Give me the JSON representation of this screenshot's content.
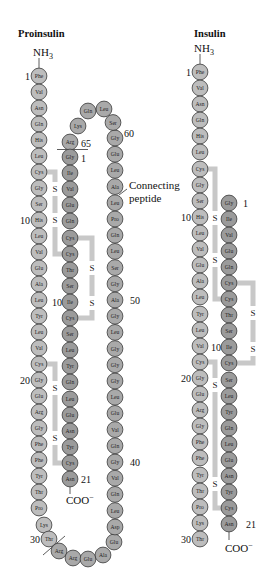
{
  "colors": {
    "b_chain_fill": "#bdbdbd",
    "a_chain_fill": "#9b9b9b",
    "c_peptide_fill": "#a9a9a9",
    "residue_stroke": "#3a3a3a",
    "bridge": "#c8c8c8"
  },
  "proinsulin": {
    "title": "Proinsulin",
    "n_terminus": {
      "base": "NH",
      "sub": "3"
    },
    "c_terminus": {
      "base": "COO",
      "sup": "−"
    },
    "connecting_peptide_label": {
      "line1": "Connecting",
      "line2": "peptide"
    },
    "disulfide_label": "S",
    "numbers": {
      "b1": "1",
      "b10": "10",
      "b20": "20",
      "b30": "30",
      "a1": "1",
      "a10": "10",
      "a21": "21",
      "c40": "40",
      "c50": "50",
      "c60": "60",
      "c65": "65"
    },
    "b_chain": [
      {
        "n": 1,
        "aa": "Phe",
        "x": 39,
        "y": 76
      },
      {
        "n": 2,
        "aa": "Val",
        "x": 39,
        "y": 92
      },
      {
        "n": 3,
        "aa": "Asn",
        "x": 39,
        "y": 108
      },
      {
        "n": 4,
        "aa": "Gln",
        "x": 39,
        "y": 124
      },
      {
        "n": 5,
        "aa": "His",
        "x": 39,
        "y": 140
      },
      {
        "n": 6,
        "aa": "Leu",
        "x": 39,
        "y": 156
      },
      {
        "n": 7,
        "aa": "Cys",
        "x": 39,
        "y": 172
      },
      {
        "n": 8,
        "aa": "Gly",
        "x": 39,
        "y": 188
      },
      {
        "n": 9,
        "aa": "Ser",
        "x": 39,
        "y": 204
      },
      {
        "n": 10,
        "aa": "His",
        "x": 39,
        "y": 220
      },
      {
        "n": 11,
        "aa": "Leu",
        "x": 39,
        "y": 236
      },
      {
        "n": 12,
        "aa": "Val",
        "x": 39,
        "y": 252
      },
      {
        "n": 13,
        "aa": "Glu",
        "x": 39,
        "y": 268
      },
      {
        "n": 14,
        "aa": "Ala",
        "x": 39,
        "y": 284
      },
      {
        "n": 15,
        "aa": "Leu",
        "x": 39,
        "y": 300
      },
      {
        "n": 16,
        "aa": "Tyr",
        "x": 39,
        "y": 316
      },
      {
        "n": 17,
        "aa": "Leu",
        "x": 39,
        "y": 332
      },
      {
        "n": 18,
        "aa": "Val",
        "x": 39,
        "y": 348
      },
      {
        "n": 19,
        "aa": "Cys",
        "x": 39,
        "y": 364
      },
      {
        "n": 20,
        "aa": "Gly",
        "x": 39,
        "y": 380
      },
      {
        "n": 21,
        "aa": "Glu",
        "x": 39,
        "y": 396
      },
      {
        "n": 22,
        "aa": "Arg",
        "x": 39,
        "y": 412
      },
      {
        "n": 23,
        "aa": "Gly",
        "x": 39,
        "y": 428
      },
      {
        "n": 24,
        "aa": "Phe",
        "x": 39,
        "y": 444
      },
      {
        "n": 25,
        "aa": "Phe",
        "x": 39,
        "y": 460
      },
      {
        "n": 26,
        "aa": "Tyr",
        "x": 39,
        "y": 476
      },
      {
        "n": 27,
        "aa": "Thr",
        "x": 39,
        "y": 492
      },
      {
        "n": 28,
        "aa": "Pro",
        "x": 39,
        "y": 508
      },
      {
        "n": 29,
        "aa": "Lys",
        "x": 44,
        "y": 525
      },
      {
        "n": 30,
        "aa": "Thr",
        "x": 49,
        "y": 539
      }
    ],
    "c_peptide": [
      {
        "n": 31,
        "aa": "Arg",
        "x": 59,
        "y": 551
      },
      {
        "n": 32,
        "aa": "Arg",
        "x": 73,
        "y": 558
      },
      {
        "n": 33,
        "aa": "Glu",
        "x": 88,
        "y": 559
      },
      {
        "n": 34,
        "aa": "Ala",
        "x": 103,
        "y": 555
      },
      {
        "n": 35,
        "aa": "Glu",
        "x": 114,
        "y": 542
      },
      {
        "n": 36,
        "aa": "Asp",
        "x": 115,
        "y": 527
      },
      {
        "n": 37,
        "aa": "Leu",
        "x": 115,
        "y": 510.6
      },
      {
        "n": 38,
        "aa": "Gln",
        "x": 115,
        "y": 494.4
      },
      {
        "n": 39,
        "aa": "Val",
        "x": 115,
        "y": 478.2
      },
      {
        "n": 40,
        "aa": "Gly",
        "x": 115,
        "y": 462
      },
      {
        "n": 41,
        "aa": "Gln",
        "x": 115,
        "y": 445.8
      },
      {
        "n": 42,
        "aa": "Val",
        "x": 115,
        "y": 429.6
      },
      {
        "n": 43,
        "aa": "Glu",
        "x": 115,
        "y": 413.4
      },
      {
        "n": 44,
        "aa": "Leu",
        "x": 115,
        "y": 397.2
      },
      {
        "n": 45,
        "aa": "Gly",
        "x": 115,
        "y": 381
      },
      {
        "n": 46,
        "aa": "Gly",
        "x": 115,
        "y": 364.8
      },
      {
        "n": 47,
        "aa": "Gly",
        "x": 115,
        "y": 348.6
      },
      {
        "n": 48,
        "aa": "Leu",
        "x": 115,
        "y": 332.4
      },
      {
        "n": 49,
        "aa": "Gly",
        "x": 115,
        "y": 316.2
      },
      {
        "n": 50,
        "aa": "Ala",
        "x": 115,
        "y": 300
      },
      {
        "n": 51,
        "aa": "Gly",
        "x": 115,
        "y": 283.8
      },
      {
        "n": 52,
        "aa": "Ser",
        "x": 115,
        "y": 267.6
      },
      {
        "n": 53,
        "aa": "Leu",
        "x": 115,
        "y": 251.4
      },
      {
        "n": 54,
        "aa": "Gln",
        "x": 115,
        "y": 235.2
      },
      {
        "n": 55,
        "aa": "Pro",
        "x": 115,
        "y": 219
      },
      {
        "n": 56,
        "aa": "Leu",
        "x": 115,
        "y": 202.8
      },
      {
        "n": 57,
        "aa": "Ala",
        "x": 115,
        "y": 186.6
      },
      {
        "n": 58,
        "aa": "Leu",
        "x": 115,
        "y": 170.4
      },
      {
        "n": 59,
        "aa": "Glu",
        "x": 115,
        "y": 154.2
      },
      {
        "n": 60,
        "aa": "Gly",
        "x": 115,
        "y": 138
      },
      {
        "n": 61,
        "aa": "Ser",
        "x": 113,
        "y": 122.5
      },
      {
        "n": 62,
        "aa": "Leu",
        "x": 104,
        "y": 109
      },
      {
        "n": 63,
        "aa": "Gln",
        "x": 88,
        "y": 111
      },
      {
        "n": 64,
        "aa": "Lys",
        "x": 78,
        "y": 126
      },
      {
        "n": 65,
        "aa": "Arg",
        "x": 70,
        "y": 142
      }
    ],
    "a_chain": [
      {
        "n": 1,
        "aa": "Gly",
        "x": 70,
        "y": 157
      },
      {
        "n": 2,
        "aa": "Ile",
        "x": 70,
        "y": 173
      },
      {
        "n": 3,
        "aa": "Val",
        "x": 70,
        "y": 189
      },
      {
        "n": 4,
        "aa": "Glu",
        "x": 70,
        "y": 205
      },
      {
        "n": 5,
        "aa": "Gln",
        "x": 70,
        "y": 221
      },
      {
        "n": 6,
        "aa": "Cys",
        "x": 70,
        "y": 238
      },
      {
        "n": 7,
        "aa": "Cys",
        "x": 70,
        "y": 254
      },
      {
        "n": 8,
        "aa": "Thr",
        "x": 70,
        "y": 270
      },
      {
        "n": 9,
        "aa": "Ser",
        "x": 70,
        "y": 286
      },
      {
        "n": 10,
        "aa": "Ile",
        "x": 70,
        "y": 302
      },
      {
        "n": 11,
        "aa": "Cys",
        "x": 70,
        "y": 318
      },
      {
        "n": 12,
        "aa": "Ser",
        "x": 70,
        "y": 334
      },
      {
        "n": 13,
        "aa": "Leu",
        "x": 70,
        "y": 350
      },
      {
        "n": 14,
        "aa": "Tyr",
        "x": 70,
        "y": 366
      },
      {
        "n": 15,
        "aa": "Gln",
        "x": 70,
        "y": 382
      },
      {
        "n": 16,
        "aa": "Leu",
        "x": 70,
        "y": 399
      },
      {
        "n": 17,
        "aa": "Glu",
        "x": 70,
        "y": 415
      },
      {
        "n": 18,
        "aa": "Asn",
        "x": 70,
        "y": 431
      },
      {
        "n": 19,
        "aa": "Tyr",
        "x": 70,
        "y": 447
      },
      {
        "n": 20,
        "aa": "Cys",
        "x": 70,
        "y": 463
      },
      {
        "n": 21,
        "aa": "Asn",
        "x": 70,
        "y": 479
      }
    ]
  },
  "insulin": {
    "title": "Insulin",
    "n_terminus": {
      "base": "NH",
      "sub": "3"
    },
    "c_terminus": {
      "base": "COO",
      "sup": "−"
    },
    "disulfide_label": "S",
    "numbers": {
      "b1": "1",
      "b10": "10",
      "b20": "20",
      "b30": "30",
      "a1": "1",
      "a10": "10",
      "a21": "21"
    },
    "b_chain": [
      {
        "n": 1,
        "aa": "Phe",
        "x": 200,
        "y": 72
      },
      {
        "n": 2,
        "aa": "Val",
        "x": 200,
        "y": 88
      },
      {
        "n": 3,
        "aa": "Asn",
        "x": 200,
        "y": 104
      },
      {
        "n": 4,
        "aa": "Gln",
        "x": 200,
        "y": 120
      },
      {
        "n": 5,
        "aa": "His",
        "x": 200,
        "y": 136
      },
      {
        "n": 6,
        "aa": "Leu",
        "x": 200,
        "y": 152
      },
      {
        "n": 7,
        "aa": "Cys",
        "x": 200,
        "y": 169
      },
      {
        "n": 8,
        "aa": "Gly",
        "x": 200,
        "y": 185
      },
      {
        "n": 9,
        "aa": "Ser",
        "x": 200,
        "y": 201
      },
      {
        "n": 10,
        "aa": "His",
        "x": 200,
        "y": 217
      },
      {
        "n": 11,
        "aa": "Leu",
        "x": 200,
        "y": 233
      },
      {
        "n": 12,
        "aa": "Val",
        "x": 200,
        "y": 249
      },
      {
        "n": 13,
        "aa": "Glu",
        "x": 200,
        "y": 265
      },
      {
        "n": 14,
        "aa": "Ala",
        "x": 200,
        "y": 281
      },
      {
        "n": 15,
        "aa": "Leu",
        "x": 200,
        "y": 297
      },
      {
        "n": 16,
        "aa": "Tyr",
        "x": 200,
        "y": 314
      },
      {
        "n": 17,
        "aa": "Leu",
        "x": 200,
        "y": 330
      },
      {
        "n": 18,
        "aa": "Val",
        "x": 200,
        "y": 346
      },
      {
        "n": 19,
        "aa": "Cys",
        "x": 200,
        "y": 362
      },
      {
        "n": 20,
        "aa": "Gly",
        "x": 200,
        "y": 378
      },
      {
        "n": 21,
        "aa": "Glu",
        "x": 200,
        "y": 394
      },
      {
        "n": 22,
        "aa": "Arg",
        "x": 200,
        "y": 410
      },
      {
        "n": 23,
        "aa": "Gly",
        "x": 200,
        "y": 426
      },
      {
        "n": 24,
        "aa": "Phe",
        "x": 200,
        "y": 442
      },
      {
        "n": 25,
        "aa": "Phe",
        "x": 200,
        "y": 458
      },
      {
        "n": 26,
        "aa": "Tyr",
        "x": 200,
        "y": 475
      },
      {
        "n": 27,
        "aa": "Thr",
        "x": 200,
        "y": 491
      },
      {
        "n": 28,
        "aa": "Pro",
        "x": 200,
        "y": 507
      },
      {
        "n": 29,
        "aa": "Lys",
        "x": 200,
        "y": 523
      },
      {
        "n": 30,
        "aa": "Thr",
        "x": 200,
        "y": 539
      }
    ],
    "a_chain": [
      {
        "n": 1,
        "aa": "Gly",
        "x": 229,
        "y": 203
      },
      {
        "n": 2,
        "aa": "Ile",
        "x": 229,
        "y": 219
      },
      {
        "n": 3,
        "aa": "Val",
        "x": 229,
        "y": 235
      },
      {
        "n": 4,
        "aa": "Glu",
        "x": 229,
        "y": 251
      },
      {
        "n": 5,
        "aa": "Gln",
        "x": 229,
        "y": 267
      },
      {
        "n": 6,
        "aa": "Cys",
        "x": 229,
        "y": 283
      },
      {
        "n": 7,
        "aa": "Cys",
        "x": 229,
        "y": 299
      },
      {
        "n": 8,
        "aa": "Thr",
        "x": 229,
        "y": 315
      },
      {
        "n": 9,
        "aa": "Ser",
        "x": 229,
        "y": 331
      },
      {
        "n": 10,
        "aa": "Ile",
        "x": 229,
        "y": 347
      },
      {
        "n": 11,
        "aa": "Cys",
        "x": 229,
        "y": 363
      },
      {
        "n": 12,
        "aa": "Ser",
        "x": 229,
        "y": 380
      },
      {
        "n": 13,
        "aa": "Leu",
        "x": 229,
        "y": 396
      },
      {
        "n": 14,
        "aa": "Tyr",
        "x": 229,
        "y": 412
      },
      {
        "n": 15,
        "aa": "Gln",
        "x": 229,
        "y": 428
      },
      {
        "n": 16,
        "aa": "Leu",
        "x": 229,
        "y": 444
      },
      {
        "n": 17,
        "aa": "Glu",
        "x": 229,
        "y": 460
      },
      {
        "n": 18,
        "aa": "Asn",
        "x": 229,
        "y": 476
      },
      {
        "n": 19,
        "aa": "Tyr",
        "x": 229,
        "y": 492
      },
      {
        "n": 20,
        "aa": "Cys",
        "x": 229,
        "y": 508
      },
      {
        "n": 21,
        "aa": "Asn",
        "x": 229,
        "y": 524
      }
    ]
  }
}
